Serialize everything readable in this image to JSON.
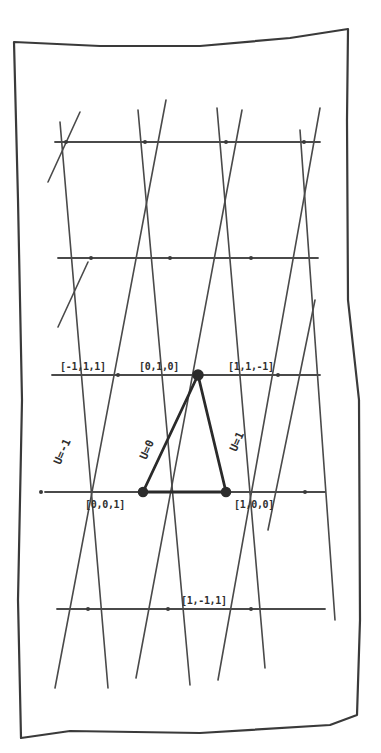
{
  "diagram": {
    "colors": {
      "ink": "#3a3a3a",
      "paper": "#ffffff"
    },
    "frame": {
      "points": [
        [
          14,
          42
        ],
        [
          100,
          46
        ],
        [
          200,
          46
        ],
        [
          290,
          38
        ],
        [
          348,
          29
        ],
        [
          347,
          120
        ],
        [
          348,
          300
        ],
        [
          359,
          400
        ],
        [
          360,
          620
        ],
        [
          357,
          715
        ],
        [
          330,
          725
        ],
        [
          200,
          733
        ],
        [
          70,
          731
        ],
        [
          21,
          738
        ],
        [
          18,
          600
        ],
        [
          22,
          400
        ],
        [
          18,
          200
        ],
        [
          14,
          42
        ]
      ]
    },
    "horizontal_lines": [
      {
        "y": 142,
        "x1": 55,
        "x2": 320
      },
      {
        "y": 258,
        "x1": 58,
        "x2": 318
      },
      {
        "y": 375,
        "x1": 52,
        "x2": 320
      },
      {
        "y": 492,
        "x1": 45,
        "x2": 325
      },
      {
        "y": 609,
        "x1": 57,
        "x2": 325
      }
    ],
    "diagonal_lines": [
      {
        "x1": 60,
        "y1": 122,
        "x2": 108,
        "y2": 688
      },
      {
        "x1": 138,
        "y1": 110,
        "x2": 190,
        "y2": 685
      },
      {
        "x1": 217,
        "y1": 108,
        "x2": 265,
        "y2": 668
      },
      {
        "x1": 300,
        "y1": 130,
        "x2": 335,
        "y2": 620
      },
      {
        "x1": 48,
        "y1": 182,
        "x2": 80,
        "y2": 112
      },
      {
        "x1": 55,
        "y1": 688,
        "x2": 166,
        "y2": 100
      },
      {
        "x1": 136,
        "y1": 678,
        "x2": 242,
        "y2": 110
      },
      {
        "x1": 218,
        "y1": 680,
        "x2": 320,
        "y2": 108
      },
      {
        "x1": 58,
        "y1": 327,
        "x2": 88,
        "y2": 262
      },
      {
        "x1": 268,
        "y1": 530,
        "x2": 315,
        "y2": 300
      }
    ],
    "highlighted_triangle": {
      "edges": [
        {
          "x1": 198,
          "y1": 375,
          "x2": 143,
          "y2": 492
        },
        {
          "x1": 198,
          "y1": 375,
          "x2": 226,
          "y2": 492
        },
        {
          "x1": 143,
          "y1": 492,
          "x2": 226,
          "y2": 492
        }
      ]
    },
    "nodes": [
      {
        "id": "node-010",
        "x": 198,
        "y": 375,
        "r": 5
      },
      {
        "id": "node-001",
        "x": 143,
        "y": 492,
        "r": 4.5
      },
      {
        "id": "node-100",
        "x": 226,
        "y": 492,
        "r": 4.5
      }
    ],
    "vertices": [
      [
        66,
        142
      ],
      [
        145,
        142
      ],
      [
        226,
        142
      ],
      [
        304,
        142
      ],
      [
        91,
        258
      ],
      [
        170,
        258
      ],
      [
        251,
        258
      ],
      [
        118,
        375
      ],
      [
        198,
        375
      ],
      [
        278,
        375
      ],
      [
        41,
        492
      ],
      [
        143,
        492
      ],
      [
        226,
        492
      ],
      [
        305,
        492
      ],
      [
        88,
        609
      ],
      [
        168,
        609
      ],
      [
        251,
        609
      ]
    ],
    "coordinate_labels": [
      {
        "text": "[-1,1,1]",
        "x": 60,
        "y": 362
      },
      {
        "text": "[0,1,0]",
        "x": 139,
        "y": 362
      },
      {
        "text": "[1,1,-1]",
        "x": 228,
        "y": 362
      },
      {
        "text": "[0,0,1]",
        "x": 85,
        "y": 500
      },
      {
        "text": "[1,0,0]",
        "x": 234,
        "y": 500
      },
      {
        "text": "[1,-1,1]",
        "x": 181,
        "y": 596
      }
    ],
    "u_labels": [
      {
        "text": "U=-1",
        "x": 62,
        "y": 455,
        "angle": -66
      },
      {
        "text": "U=0",
        "x": 148,
        "y": 450,
        "angle": -66
      },
      {
        "text": "U=1",
        "x": 238,
        "y": 442,
        "angle": -66
      }
    ]
  }
}
